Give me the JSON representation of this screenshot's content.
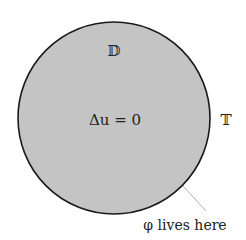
{
  "diagram": {
    "region_label": "𝔻",
    "equation": "Δu = 0",
    "boundary_label": "𝕋",
    "annotation": "φ lives here",
    "colors": {
      "disk_fill": "#c4c4c4",
      "disk_stroke": "#1a1a1a",
      "leader_line": "#9a9a9a",
      "background": "#ffffff"
    }
  }
}
